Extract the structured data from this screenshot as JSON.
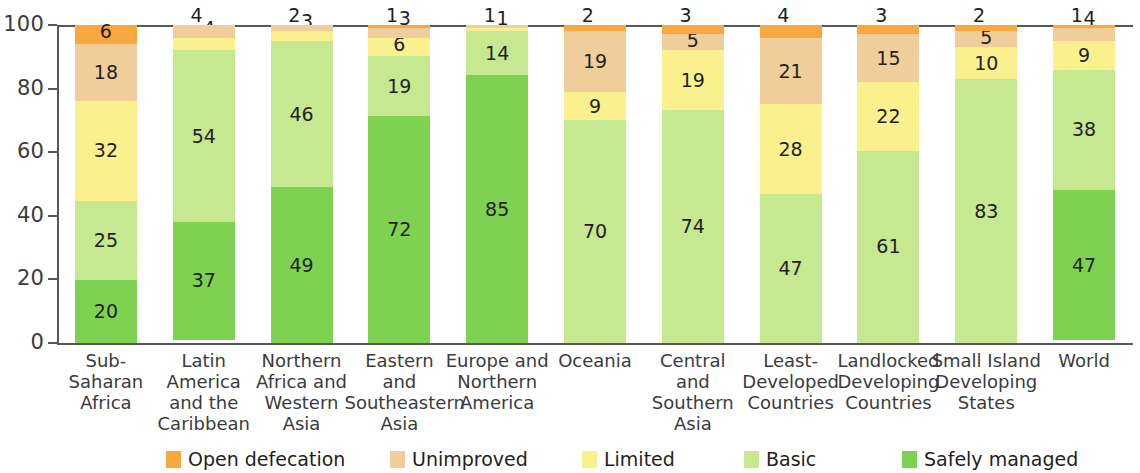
{
  "chart_data": {
    "type": "bar",
    "subtype": "stacked-bar-100",
    "title": "",
    "xlabel": "",
    "ylabel": "",
    "ylim": [
      0,
      100
    ],
    "yticks": [
      0,
      20,
      40,
      60,
      80,
      100
    ],
    "grid": false,
    "legend_position": "bottom",
    "categories": [
      "Sub-Saharan Africa",
      "Latin America and the Caribbean",
      "Northern Africa and Western Asia",
      "Eastern and Southeastern Asia",
      "Europe and Northern America",
      "Oceania",
      "Central and Southern Asia",
      "Least-Developed Countries",
      "Landlocked Developing Countries",
      "Small Island Developing States",
      "World"
    ],
    "category_lines": [
      [
        "Sub-Saharan",
        "Africa"
      ],
      [
        "Latin",
        "America",
        "and the",
        "Caribbean"
      ],
      [
        "Northern",
        "Africa and",
        "Western",
        "Asia"
      ],
      [
        "Eastern",
        "and",
        "Southeastern",
        "Asia"
      ],
      [
        "Europe and",
        "Northern",
        "America"
      ],
      [
        "Oceania"
      ],
      [
        "Central",
        "and Southern",
        "Asia"
      ],
      [
        "Least-",
        "Developed",
        "Countries"
      ],
      [
        "Landlocked",
        "Developing",
        "Countries"
      ],
      [
        "Small Island",
        "Developing",
        "States"
      ],
      [
        "World"
      ]
    ],
    "series": [
      {
        "name": "Safely managed",
        "color": "#7FD152",
        "values": [
          20,
          37,
          49,
          72,
          85,
          0,
          0,
          0,
          0,
          0,
          47
        ]
      },
      {
        "name": "Basic",
        "color": "#C5E890",
        "values": [
          25,
          54,
          46,
          19,
          14,
          70,
          74,
          47,
          61,
          83,
          38
        ]
      },
      {
        "name": "Limited",
        "color": "#FAF18E",
        "values": [
          32,
          4,
          3,
          6,
          1,
          9,
          19,
          28,
          22,
          10,
          9
        ]
      },
      {
        "name": "Unimproved",
        "color": "#EFCE9B",
        "values": [
          18,
          4,
          2,
          3,
          1,
          19,
          5,
          21,
          15,
          5,
          4
        ]
      },
      {
        "name": "Open defecation",
        "color": "#F7A93E",
        "values": [
          6,
          0,
          0,
          1,
          0,
          2,
          3,
          4,
          3,
          2,
          1
        ]
      }
    ]
  },
  "legend": {
    "items": [
      {
        "label": "Open defecation",
        "color": "#F7A93E"
      },
      {
        "label": "Unimproved",
        "color": "#EFCE9B"
      },
      {
        "label": "Limited",
        "color": "#FAF18E"
      },
      {
        "label": "Basic",
        "color": "#C5E890"
      },
      {
        "label": "Safely managed",
        "color": "#7FD152"
      }
    ]
  },
  "axis": {
    "y_tick_labels": [
      "100",
      "80",
      "60",
      "40",
      "20",
      "0"
    ]
  }
}
